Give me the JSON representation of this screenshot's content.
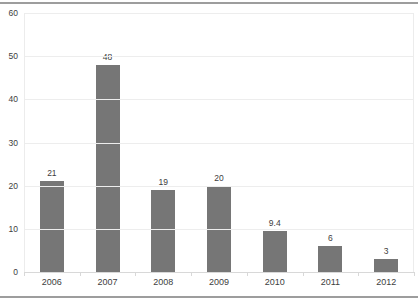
{
  "frame": {
    "top_rule_color": "#9d9d9d",
    "bottom_rule_color": "#9d9d9d"
  },
  "chart_data": {
    "type": "bar",
    "title": "",
    "xlabel": "",
    "ylabel": "",
    "categories": [
      "2006",
      "2007",
      "2008",
      "2009",
      "2010",
      "2011",
      "2012"
    ],
    "values": [
      21,
      48,
      19,
      20,
      9.4,
      6,
      3
    ],
    "value_labels": [
      "21",
      "48",
      "19",
      "20",
      "9.4",
      "6",
      "3"
    ],
    "ylim": [
      0,
      60
    ],
    "yticks": [
      0,
      10,
      20,
      30,
      40,
      50,
      60
    ],
    "grid": true,
    "legend": "none",
    "bar_color": "#767676",
    "label_color": "#404040",
    "gridline_color": "#ededed",
    "baseline_color": "#d8d8d8"
  }
}
